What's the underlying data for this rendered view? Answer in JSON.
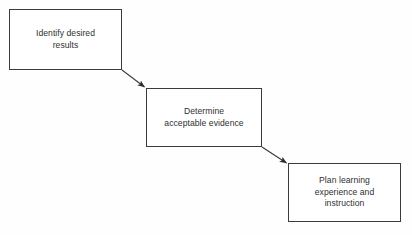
{
  "diagram": {
    "background_color": "#fefefe",
    "line_color": "#3b3b3b",
    "text_color": "#2f2f2f",
    "nodes": [
      {
        "id": "identify",
        "label": "Identify desired\nresults",
        "stage": "1",
        "x": 9,
        "y": 9,
        "width": 113,
        "height": 61
      },
      {
        "id": "determine",
        "label": "Determine\nacceptable evidence",
        "stage": "2",
        "x": 146,
        "y": 88,
        "width": 116,
        "height": 59
      },
      {
        "id": "plan",
        "label": "Plan learning\nexperience and\ninstruction",
        "stage": "3",
        "x": 288,
        "y": 163,
        "width": 113,
        "height": 59
      }
    ],
    "connectors": [
      {
        "id": "identify-to-determine",
        "from": "identify",
        "to": "determine",
        "x1": 122,
        "y1": 70,
        "x2": 146,
        "y2": 88,
        "arrowhead": "filled-triangle"
      },
      {
        "id": "determine-to-plan",
        "from": "determine",
        "to": "plan",
        "x1": 262,
        "y1": 147,
        "x2": 288,
        "y2": 164,
        "arrowhead": "filled-triangle"
      }
    ]
  }
}
